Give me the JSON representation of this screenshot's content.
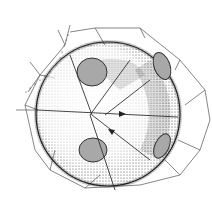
{
  "figure": {
    "colors": {
      "background": "#ffffff",
      "line": "#555555",
      "stipple": "#222222",
      "patch_fill": "#a8a8a8",
      "patch_edge": "#333333"
    },
    "sphere": {
      "cx": 108,
      "cy": 114,
      "r": 72
    },
    "patches": [
      {
        "name": "upper-left",
        "cx": 92,
        "cy": 72,
        "rx": 15,
        "ry": 14
      },
      {
        "name": "upper-right",
        "cx": 162,
        "cy": 66,
        "rx": 9,
        "ry": 14
      },
      {
        "name": "lower-left",
        "cx": 93,
        "cy": 150,
        "rx": 14,
        "ry": 12
      },
      {
        "name": "lower-right",
        "cx": 162,
        "cy": 146,
        "rx": 8,
        "ry": 13
      }
    ]
  }
}
